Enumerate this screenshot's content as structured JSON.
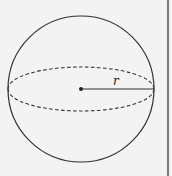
{
  "diagram": {
    "shape": "sphere",
    "radius_label": "r",
    "colors": {
      "stroke": "#333333",
      "background": "#f3f3f3",
      "border": "#7a7a7a"
    }
  }
}
